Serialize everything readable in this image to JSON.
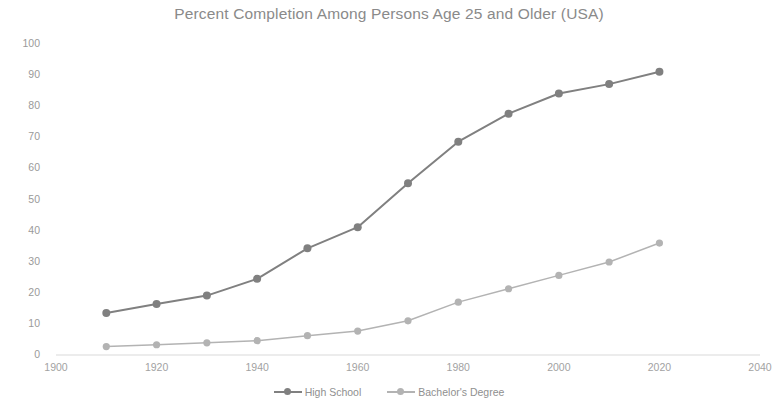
{
  "chart_data": {
    "type": "line",
    "title": "Percent Completion Among Persons Age 25 and Older (USA)",
    "xlabel": "",
    "ylabel": "",
    "xlim": [
      1900,
      2040
    ],
    "ylim": [
      0,
      100
    ],
    "xticks": [
      1900,
      1920,
      1940,
      1960,
      1980,
      2000,
      2020,
      2040
    ],
    "yticks": [
      0,
      10,
      20,
      30,
      40,
      50,
      60,
      70,
      80,
      90,
      100
    ],
    "grid": false,
    "legend_position": "bottom",
    "x": [
      1910,
      1920,
      1930,
      1940,
      1950,
      1960,
      1970,
      1980,
      1990,
      2000,
      2010,
      2020
    ],
    "series": [
      {
        "name": "High School",
        "color": "#808080",
        "values": [
          13.5,
          16.4,
          19.1,
          24.5,
          34.3,
          41.1,
          55.2,
          68.6,
          77.6,
          84.1,
          87.1,
          91.1
        ]
      },
      {
        "name": "Bachelor's Degree",
        "color": "#b3b3b3",
        "values": [
          2.7,
          3.3,
          3.9,
          4.6,
          6.2,
          7.7,
          11.0,
          17.0,
          21.3,
          25.6,
          29.9,
          36.0
        ]
      }
    ]
  },
  "legend": {
    "entries": [
      {
        "label": "High School"
      },
      {
        "label": "Bachelor's Degree"
      }
    ]
  }
}
